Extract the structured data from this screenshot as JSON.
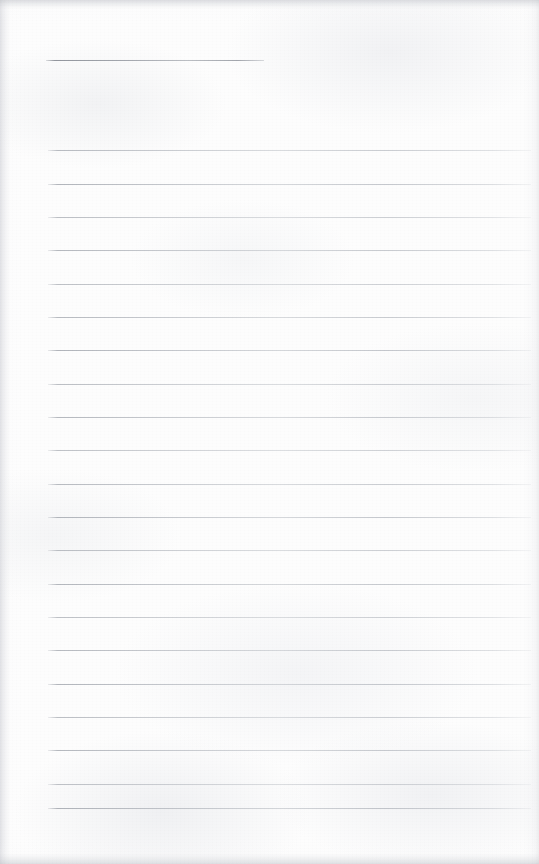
{
  "document": {
    "type": "scanned-lined-paper",
    "title": "Blank ruled notebook page",
    "page_width": 539,
    "page_height": 864,
    "background_color": "#fdfdfd",
    "rule_color": "#b0b4ba",
    "rule_color_dark": "#8c9098",
    "text_content": "",
    "handwriting_present": "none",
    "visible_text": []
  },
  "ruling": {
    "line_count": 21,
    "line_spacing_px": 33.3,
    "left_margin_px": 47,
    "right_margin_px": 531,
    "first_line_is_partial": true,
    "first_line_end_px": 264,
    "lines": [
      {
        "index": 1,
        "y": 60,
        "x1": 46,
        "x2": 264,
        "partial": true,
        "weight": "medium"
      },
      {
        "index": 2,
        "y": 150,
        "x1": 48,
        "x2": 531,
        "partial": false,
        "weight": "light"
      },
      {
        "index": 3,
        "y": 184,
        "x1": 48,
        "x2": 531,
        "partial": false,
        "weight": "light"
      },
      {
        "index": 4,
        "y": 217,
        "x1": 48,
        "x2": 531,
        "partial": false,
        "weight": "light"
      },
      {
        "index": 5,
        "y": 250,
        "x1": 48,
        "x2": 531,
        "partial": false,
        "weight": "light"
      },
      {
        "index": 6,
        "y": 284,
        "x1": 48,
        "x2": 531,
        "partial": false,
        "weight": "light"
      },
      {
        "index": 7,
        "y": 317,
        "x1": 48,
        "x2": 531,
        "partial": false,
        "weight": "light"
      },
      {
        "index": 8,
        "y": 350,
        "x1": 48,
        "x2": 531,
        "partial": false,
        "weight": "light"
      },
      {
        "index": 9,
        "y": 384,
        "x1": 48,
        "x2": 531,
        "partial": false,
        "weight": "light"
      },
      {
        "index": 10,
        "y": 417,
        "x1": 48,
        "x2": 531,
        "partial": false,
        "weight": "light"
      },
      {
        "index": 11,
        "y": 450,
        "x1": 48,
        "x2": 531,
        "partial": false,
        "weight": "light"
      },
      {
        "index": 12,
        "y": 484,
        "x1": 48,
        "x2": 531,
        "partial": false,
        "weight": "light"
      },
      {
        "index": 13,
        "y": 517,
        "x1": 48,
        "x2": 531,
        "partial": false,
        "weight": "light"
      },
      {
        "index": 14,
        "y": 550,
        "x1": 48,
        "x2": 531,
        "partial": false,
        "weight": "light"
      },
      {
        "index": 15,
        "y": 584,
        "x1": 48,
        "x2": 531,
        "partial": false,
        "weight": "light"
      },
      {
        "index": 16,
        "y": 617,
        "x1": 48,
        "x2": 531,
        "partial": false,
        "weight": "light"
      },
      {
        "index": 17,
        "y": 650,
        "x1": 48,
        "x2": 531,
        "partial": false,
        "weight": "light"
      },
      {
        "index": 18,
        "y": 684,
        "x1": 48,
        "x2": 531,
        "partial": false,
        "weight": "light"
      },
      {
        "index": 19,
        "y": 717,
        "x1": 48,
        "x2": 531,
        "partial": false,
        "weight": "light"
      },
      {
        "index": 20,
        "y": 750,
        "x1": 48,
        "x2": 531,
        "partial": false,
        "weight": "light"
      },
      {
        "index": 21,
        "y": 784,
        "x1": 48,
        "x2": 531,
        "partial": false,
        "weight": "light"
      },
      {
        "index": 22,
        "y": 808,
        "x1": 48,
        "x2": 531,
        "partial": false,
        "weight": "medium"
      }
    ]
  }
}
